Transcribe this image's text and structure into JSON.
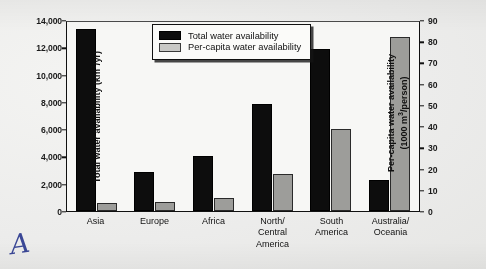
{
  "chart_data": {
    "type": "bar",
    "title": "",
    "categories": [
      "Asia",
      "Europe",
      "Africa",
      "North/\nCentral\nAmerica",
      "South\nAmerica",
      "Australia/\nOceania"
    ],
    "series": [
      {
        "name": "Total water availability",
        "axis": "left",
        "color": "#0d0d0d",
        "unit": "km3/yr",
        "values": [
          13500,
          2900,
          4050,
          7900,
          12000,
          2300
        ]
      },
      {
        "name": "Per-capita water availability",
        "axis": "right",
        "color": "#9d9d9a",
        "unit": "1000 m3/person",
        "values": [
          4,
          4.5,
          6,
          17.5,
          39,
          83
        ]
      }
    ],
    "xlabel": "",
    "ylabel": "Total water availability (km3/yr)",
    "ylabel_right": "Per-capita water availability (1000 m3/person)",
    "ylim": [
      0,
      14000
    ],
    "ylim_right": [
      0,
      90
    ],
    "yticks": [
      0,
      2000,
      4000,
      6000,
      8000,
      10000,
      12000,
      14000
    ],
    "yticks_right": [
      0,
      10,
      20,
      30,
      40,
      50,
      60,
      70,
      80,
      90
    ],
    "grid": false,
    "legend_position": "top-center"
  },
  "axes": {
    "left": {
      "title_main": "Total water availability (km",
      "title_sup": "3",
      "title_tail": "/yr)",
      "ticks": [
        "14,000",
        "12,000",
        "10,000",
        "8,000",
        "6,000",
        "4,000",
        "2,000",
        "0"
      ]
    },
    "right": {
      "title_main": "Per-capita water availability",
      "title_line2_pre": "(1000 m",
      "title_sup": "3",
      "title_line2_post": "/person)",
      "ticks": [
        "90",
        "80",
        "70",
        "60",
        "50",
        "40",
        "30",
        "20",
        "10",
        "0"
      ]
    }
  },
  "categories": [
    {
      "label": "Asia"
    },
    {
      "label": "Europe"
    },
    {
      "label": "Africa"
    },
    {
      "label": "North/\nCentral\nAmerica"
    },
    {
      "label": "South\nAmerica"
    },
    {
      "label": "Australia/\nOceania"
    }
  ],
  "legend": {
    "items": [
      {
        "label": "Total water availability",
        "swatch": "black"
      },
      {
        "label": "Per-capita water availability",
        "swatch": "gray"
      }
    ]
  },
  "annotation": {
    "handwritten_mark": "A"
  }
}
